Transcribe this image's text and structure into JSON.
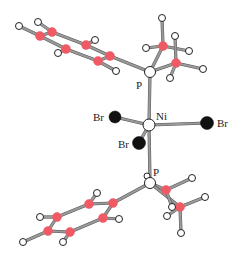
{
  "diagram": {
    "type": "molecular-structure",
    "colors": {
      "carbon": "#ef5a64",
      "hydrogen": "#ffffff",
      "phosphorus": "#ffffff",
      "nickel": "#ffffff",
      "bromine": "#111111",
      "bond": "#9a9a9a"
    },
    "labels": {
      "p_top": "P",
      "ni": "Ni",
      "br_left": "Br",
      "br_right": "Br",
      "br_lower": "Br",
      "p_bottom": "P"
    },
    "atoms": [
      {
        "id": "Ni",
        "el": "Ni",
        "x": 149,
        "y": 125,
        "r": 6
      },
      {
        "id": "Br1",
        "el": "Br",
        "x": 115,
        "y": 117,
        "r": 6
      },
      {
        "id": "Br2",
        "el": "Br",
        "x": 207,
        "y": 123,
        "r": 6.5
      },
      {
        "id": "Br3",
        "el": "Br",
        "x": 139,
        "y": 143,
        "r": 6.5
      },
      {
        "id": "P1",
        "el": "P",
        "x": 150,
        "y": 72,
        "r": 5.5
      },
      {
        "id": "Cm1",
        "el": "C",
        "x": 163,
        "y": 46,
        "r": 4.5
      },
      {
        "id": "Cm2",
        "el": "C",
        "x": 176,
        "y": 63,
        "r": 4.5
      },
      {
        "id": "Hm1",
        "el": "H",
        "x": 162,
        "y": 18,
        "r": 3.5
      },
      {
        "id": "Hm2",
        "el": "H",
        "x": 146,
        "y": 48,
        "r": 3.5
      },
      {
        "id": "Hm3",
        "el": "H",
        "x": 175,
        "y": 36,
        "r": 3.5
      },
      {
        "id": "Hm4",
        "el": "H",
        "x": 189,
        "y": 51,
        "r": 3.5
      },
      {
        "id": "Hm5",
        "el": "H",
        "x": 203,
        "y": 69,
        "r": 3.5
      },
      {
        "id": "Hm6",
        "el": "H",
        "x": 170,
        "y": 78,
        "r": 3.5
      },
      {
        "id": "Ca1",
        "el": "C",
        "x": 40,
        "y": 36,
        "r": 4.5
      },
      {
        "id": "Ca2",
        "el": "C",
        "x": 52,
        "y": 32,
        "r": 4.5
      },
      {
        "id": "Ca3",
        "el": "C",
        "x": 86,
        "y": 45,
        "r": 4.5
      },
      {
        "id": "Ca4",
        "el": "C",
        "x": 110,
        "y": 56,
        "r": 4.5
      },
      {
        "id": "Ca5",
        "el": "C",
        "x": 98,
        "y": 61,
        "r": 4.5
      },
      {
        "id": "Ca6",
        "el": "C",
        "x": 66,
        "y": 49,
        "r": 4.5
      },
      {
        "id": "Ha1",
        "el": "H",
        "x": 19,
        "y": 26,
        "r": 3.5
      },
      {
        "id": "Ha2",
        "el": "H",
        "x": 38,
        "y": 22,
        "r": 3.5
      },
      {
        "id": "Ha3",
        "el": "H",
        "x": 95,
        "y": 40,
        "r": 3.5
      },
      {
        "id": "Ha6",
        "el": "H",
        "x": 58,
        "y": 53,
        "r": 3.5
      },
      {
        "id": "Ha5",
        "el": "H",
        "x": 116,
        "y": 71,
        "r": 3.5
      },
      {
        "id": "P2",
        "el": "P",
        "x": 150,
        "y": 183,
        "r": 5.5
      },
      {
        "id": "Hp",
        "el": "H",
        "x": 147,
        "y": 176,
        "r": 3
      },
      {
        "id": "Cn1",
        "el": "C",
        "x": 166,
        "y": 190,
        "r": 4.5
      },
      {
        "id": "Cn2",
        "el": "C",
        "x": 180,
        "y": 207,
        "r": 4.5
      },
      {
        "id": "Hn1",
        "el": "H",
        "x": 192,
        "y": 178,
        "r": 3.5
      },
      {
        "id": "Hn2",
        "el": "H",
        "x": 205,
        "y": 197,
        "r": 3.5
      },
      {
        "id": "Hn3",
        "el": "H",
        "x": 172,
        "y": 207,
        "r": 3.5
      },
      {
        "id": "Hn4",
        "el": "H",
        "x": 167,
        "y": 216,
        "r": 3.5
      },
      {
        "id": "Hn5",
        "el": "H",
        "x": 181,
        "y": 233,
        "r": 3.5
      },
      {
        "id": "Cb1",
        "el": "C",
        "x": 113,
        "y": 203,
        "r": 4.5
      },
      {
        "id": "Cb2",
        "el": "C",
        "x": 89,
        "y": 204,
        "r": 4.5
      },
      {
        "id": "Cb3",
        "el": "C",
        "x": 57,
        "y": 217,
        "r": 4.5
      },
      {
        "id": "Cb4",
        "el": "C",
        "x": 48,
        "y": 231,
        "r": 4.5
      },
      {
        "id": "Cb5",
        "el": "C",
        "x": 70,
        "y": 232,
        "r": 4.5
      },
      {
        "id": "Cb6",
        "el": "C",
        "x": 103,
        "y": 218,
        "r": 4.5
      },
      {
        "id": "Hb2",
        "el": "H",
        "x": 97,
        "y": 193,
        "r": 3.5
      },
      {
        "id": "Hb3",
        "el": "H",
        "x": 40,
        "y": 217,
        "r": 3.5
      },
      {
        "id": "Hb4",
        "el": "H",
        "x": 23,
        "y": 242,
        "r": 3.5
      },
      {
        "id": "Hb5",
        "el": "H",
        "x": 63,
        "y": 242,
        "r": 3.5
      },
      {
        "id": "Hb6",
        "el": "H",
        "x": 119,
        "y": 219,
        "r": 3.5
      }
    ],
    "bonds": [
      [
        "Ni",
        "P1"
      ],
      [
        "Ni",
        "P2"
      ],
      [
        "Ni",
        "Br1"
      ],
      [
        "Ni",
        "Br2"
      ],
      [
        "Ni",
        "Br3"
      ],
      [
        "P1",
        "Ca4"
      ],
      [
        "P1",
        "Cm1"
      ],
      [
        "P1",
        "Cm2"
      ],
      [
        "Cm1",
        "Hm1"
      ],
      [
        "Cm1",
        "Hm2"
      ],
      [
        "Cm1",
        "Hm4"
      ],
      [
        "Cm2",
        "Hm3"
      ],
      [
        "Cm2",
        "Hm5"
      ],
      [
        "Cm2",
        "Hm6"
      ],
      [
        "Ca1",
        "Ca2"
      ],
      [
        "Ca2",
        "Ca3"
      ],
      [
        "Ca3",
        "Ca4"
      ],
      [
        "Ca4",
        "Ca5"
      ],
      [
        "Ca5",
        "Ca6"
      ],
      [
        "Ca6",
        "Ca1"
      ],
      [
        "Ca1",
        "Ha1"
      ],
      [
        "Ca2",
        "Ha2"
      ],
      [
        "Ca3",
        "Ha3"
      ],
      [
        "Ca6",
        "Ha6"
      ],
      [
        "Ca5",
        "Ha5"
      ],
      [
        "P2",
        "Cb1"
      ],
      [
        "P2",
        "Cn1"
      ],
      [
        "P2",
        "Cn2"
      ],
      [
        "Cn1",
        "Hn1"
      ],
      [
        "Cn1",
        "Hn3"
      ],
      [
        "Cn2",
        "Hn2"
      ],
      [
        "Cn2",
        "Hn4"
      ],
      [
        "Cn2",
        "Hn5"
      ],
      [
        "Cb1",
        "Cb2"
      ],
      [
        "Cb2",
        "Cb3"
      ],
      [
        "Cb3",
        "Cb4"
      ],
      [
        "Cb4",
        "Cb5"
      ],
      [
        "Cb5",
        "Cb6"
      ],
      [
        "Cb6",
        "Cb1"
      ],
      [
        "Cb2",
        "Hb2"
      ],
      [
        "Cb3",
        "Hb3"
      ],
      [
        "Cb4",
        "Hb4"
      ],
      [
        "Cb5",
        "Hb5"
      ],
      [
        "Cb6",
        "Hb6"
      ]
    ]
  }
}
